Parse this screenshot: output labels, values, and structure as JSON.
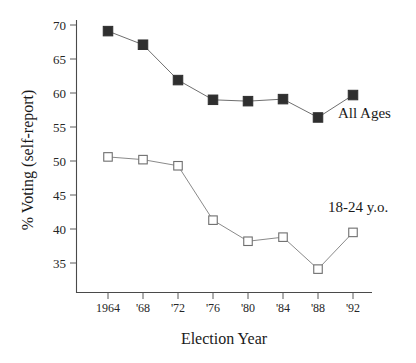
{
  "chart_data": {
    "type": "line",
    "title": "",
    "xlabel": "Election Year",
    "ylabel": "% Voting (self-report)",
    "categories": [
      "1964",
      "'68",
      "'72",
      "'76",
      "'80",
      "'84",
      "'88",
      "'92"
    ],
    "x_tick_labels": [
      "1964",
      "'68",
      "'72",
      "'76",
      "'80",
      "'84",
      "'88",
      "'92"
    ],
    "y_tick_labels": [
      "70",
      "65",
      "60",
      "55",
      "50",
      "45",
      "40",
      "35"
    ],
    "y_ticks": [
      70,
      65,
      60,
      55,
      50,
      45,
      40,
      35
    ],
    "ylim": [
      31.5,
      71.5
    ],
    "grid": false,
    "legend_position": "inline-right",
    "series": [
      {
        "name": "All Ages",
        "marker": "filled-square",
        "color": "#2f2f2f",
        "values": [
          69.1,
          67.1,
          61.9,
          59.0,
          58.8,
          59.1,
          56.4,
          59.7
        ]
      },
      {
        "name": "18-24 y.o.",
        "marker": "open-square",
        "color": "#6e6e6e",
        "values": [
          50.6,
          50.2,
          49.3,
          41.3,
          38.2,
          38.8,
          34.1,
          39.5
        ]
      }
    ],
    "annotations": [
      {
        "text": "All Ages",
        "x": 0.895,
        "y": 57.0
      },
      {
        "text": "18-24 y.o.",
        "x": 0.885,
        "y": 43.2
      }
    ]
  },
  "labels": {
    "x_axis_title": "Election Year",
    "y_axis_title": "% Voting (self-report)",
    "series_all_ages": "All Ages",
    "series_young": "18-24 y.o."
  },
  "colors": {
    "axis": "#4a4a4a",
    "filled_marker": "#2f2f2f",
    "open_marker_stroke": "#6e6e6e",
    "line_all_ages": "#6f6f6f",
    "line_young": "#8a8a8a",
    "background": "#ffffff",
    "text": "#1a1a1a"
  }
}
